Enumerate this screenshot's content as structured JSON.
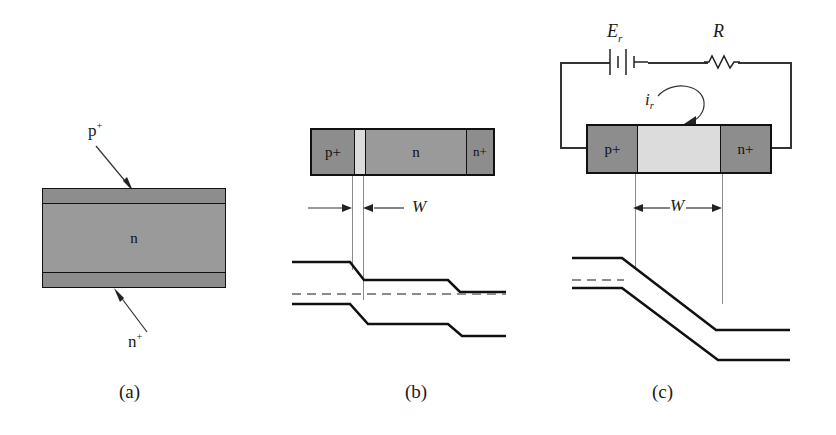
{
  "figure": {
    "type": "semiconductor-device-band-diagram",
    "panel_captions": [
      "(a)",
      "(b)",
      "(c)"
    ]
  },
  "panel_a": {
    "caption": "(a)",
    "top_layer_label": "p",
    "top_layer_sup": "+",
    "middle_layer_label": "n",
    "bottom_layer_label": "n",
    "bottom_layer_sup": "+",
    "callout_top": "p+",
    "callout_bottom": "n+"
  },
  "panel_b": {
    "caption": "(b)",
    "regions": [
      {
        "label": "p",
        "sup": "+",
        "shade": "dark"
      },
      {
        "label": "",
        "sup": "",
        "shade": "light"
      },
      {
        "label": "n",
        "sup": "",
        "shade": "mid"
      },
      {
        "label": "n",
        "sup": "+",
        "shade": "dark"
      }
    ],
    "width_label": "W"
  },
  "panel_c": {
    "caption": "(c)",
    "regions": [
      {
        "label": "p",
        "sup": "+",
        "shade": "dark"
      },
      {
        "label": "",
        "sup": "",
        "shade": "light"
      },
      {
        "label": "n",
        "sup": "+",
        "shade": "dark"
      }
    ],
    "width_label": "W",
    "circuit": {
      "source_label": "E",
      "source_sub": "r",
      "resistor_label": "R",
      "current_label": "i",
      "current_sub": "r"
    }
  },
  "colors": {
    "ink": "#111111",
    "heavily_doped_gray": "#8d8d8d",
    "moderate_gray": "#9a9a9a",
    "depletion_light": "#dcdcdc",
    "fermi_dash": "#8a8a8a",
    "background": "#ffffff"
  }
}
